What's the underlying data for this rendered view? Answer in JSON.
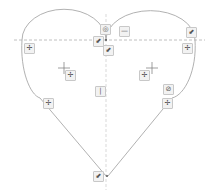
{
  "app": {
    "view": "sketch-canvas"
  },
  "sketch": {
    "shape": "heart",
    "line_color": "#a8a8a8",
    "construction_color": "#b0b0b0",
    "constraint_bg": "#f2f2f2"
  },
  "constraints": [
    {
      "type": "concentric",
      "glyph": "◎",
      "x": 104,
      "y": 28
    },
    {
      "type": "horizontal",
      "glyph": "—",
      "x": 121,
      "y": 30
    },
    {
      "type": "coincident",
      "glyph": "⬋",
      "x": 95,
      "y": 38
    },
    {
      "type": "coincident",
      "glyph": "⬋",
      "x": 104,
      "y": 47
    },
    {
      "type": "coincident",
      "glyph": "⬋",
      "x": 189,
      "y": 29
    },
    {
      "type": "tangent-move",
      "glyph": "✢",
      "x": 25,
      "y": 45
    },
    {
      "type": "tangent-move",
      "glyph": "✢",
      "x": 185,
      "y": 45
    },
    {
      "type": "tangent-move",
      "glyph": "✢",
      "x": 67,
      "y": 73
    },
    {
      "type": "tangent-move",
      "glyph": "✢",
      "x": 141,
      "y": 73
    },
    {
      "type": "vertical",
      "glyph": "|",
      "x": 96,
      "y": 88
    },
    {
      "type": "tangent",
      "glyph": "⊘",
      "x": 164,
      "y": 87
    },
    {
      "type": "tangent-move",
      "glyph": "✢",
      "x": 45,
      "y": 101
    },
    {
      "type": "tangent-move",
      "glyph": "✢",
      "x": 164,
      "y": 101
    },
    {
      "type": "coincident",
      "glyph": "⬋",
      "x": 94,
      "y": 173
    }
  ]
}
